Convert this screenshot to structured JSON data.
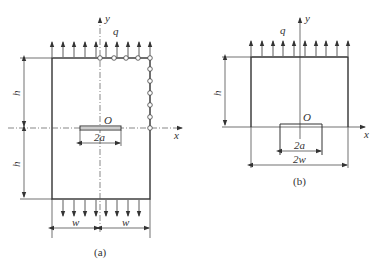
{
  "figure_a": {
    "caption": "(a)",
    "labels": {
      "y_axis": "y",
      "x_axis": "x",
      "load": "q",
      "origin": "O",
      "crack_length": "2a",
      "height_top": "h",
      "height_bottom": "h",
      "width_left": "w",
      "width_right": "w"
    }
  },
  "figure_b": {
    "caption": "(b)",
    "labels": {
      "y_axis": "y",
      "x_axis": "x",
      "load": "q",
      "origin": "O",
      "crack_length": "2a",
      "total_width": "2w",
      "height": "h"
    }
  },
  "colors": {
    "line": "#333333",
    "background": "#ffffff"
  }
}
